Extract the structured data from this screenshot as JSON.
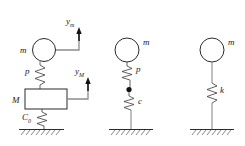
{
  "figure": {
    "background_color": "#ffffff",
    "line_color": "#2b2b2b",
    "hatch_color": "#6e6e6e",
    "connector_color": "#8c8c8c"
  },
  "systems": [
    {
      "id": "system-left",
      "mass_upper_label": "m",
      "mass_lower_label": "M",
      "spring_label": "p",
      "damper_label": "C",
      "damper_sub": "0",
      "arrow_upper_label": "y",
      "arrow_upper_sub": "m",
      "arrow_lower_label": "y",
      "arrow_lower_sub": "M"
    },
    {
      "id": "system-middle",
      "mass_label": "m",
      "spring_label": "p",
      "damper_label": "c"
    },
    {
      "id": "system-right",
      "mass_label": "m",
      "spring_label": "k"
    }
  ]
}
